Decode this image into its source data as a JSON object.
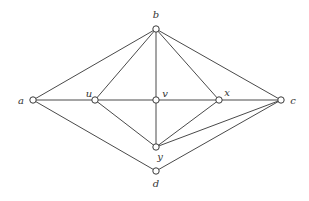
{
  "diagram": {
    "type": "graph",
    "nodes": [
      {
        "id": "a",
        "label": "a",
        "x": 33,
        "y": 100,
        "lx": 21,
        "ly": 104
      },
      {
        "id": "b",
        "label": "b",
        "x": 156,
        "y": 29,
        "lx": 156,
        "ly": 18
      },
      {
        "id": "c",
        "label": "c",
        "x": 281,
        "y": 100,
        "lx": 293,
        "ly": 104
      },
      {
        "id": "d",
        "label": "d",
        "x": 156,
        "y": 171,
        "lx": 156,
        "ly": 187
      },
      {
        "id": "u",
        "label": "u",
        "x": 95,
        "y": 100,
        "lx": 89,
        "ly": 97
      },
      {
        "id": "v",
        "label": "v",
        "x": 156,
        "y": 100,
        "lx": 165,
        "ly": 97
      },
      {
        "id": "x",
        "label": "x",
        "x": 219,
        "y": 100,
        "lx": 227,
        "ly": 96
      },
      {
        "id": "y",
        "label": "y",
        "x": 156,
        "y": 147,
        "lx": 160,
        "ly": 160
      }
    ],
    "edges": [
      [
        "a",
        "b"
      ],
      [
        "b",
        "u"
      ],
      [
        "b",
        "v"
      ],
      [
        "b",
        "x"
      ],
      [
        "b",
        "c"
      ],
      [
        "a",
        "u"
      ],
      [
        "u",
        "v"
      ],
      [
        "v",
        "x"
      ],
      [
        "x",
        "c"
      ],
      [
        "a",
        "d"
      ],
      [
        "d",
        "c"
      ],
      [
        "u",
        "y"
      ],
      [
        "v",
        "y"
      ],
      [
        "x",
        "y"
      ],
      [
        "y",
        "c"
      ]
    ]
  },
  "labels": {
    "a": "a",
    "b": "b",
    "c": "c",
    "d": "d",
    "u": "u",
    "v": "v",
    "x": "x",
    "y": "y"
  }
}
